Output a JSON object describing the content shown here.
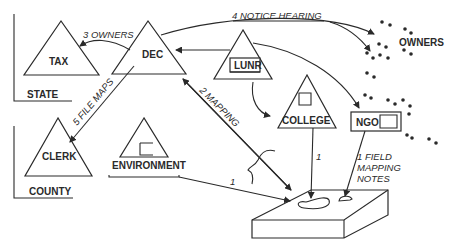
{
  "diagram": {
    "groups": {
      "state": "STATE",
      "county": "COUNTY"
    },
    "nodes": {
      "tax": "TAX",
      "dec": "DEC",
      "lunr": "LUNR",
      "college": "COLLEGE",
      "ngo": "NGO",
      "clerk": "CLERK",
      "environment": "ENVIRONMENT",
      "owners": "OWNERS"
    },
    "edges": {
      "dec_to_tax": "3 OWNERS",
      "dec_to_owners": "4 NOTICE HEARING",
      "dec_to_clerk": "5 FILE MAPS",
      "dec_land": "2 MAPPING",
      "environment_to_land": "1",
      "college_to_land": "1",
      "ngo_to_land_line1": "1 FIELD",
      "ngo_to_land_line2": "MAPPING",
      "ngo_to_land_line3": "NOTES"
    }
  }
}
